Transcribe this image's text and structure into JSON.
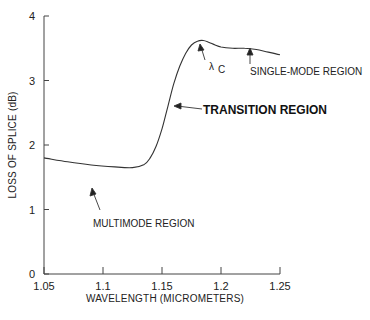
{
  "chart_data": {
    "type": "line",
    "title": "",
    "xlabel": "WAVELENGTH (MICROMETERS)",
    "ylabel": "LOSS OF SPLICE (dB)",
    "xlim": [
      1.05,
      1.25
    ],
    "ylim": [
      0,
      4
    ],
    "x_ticks": [
      "1.05",
      "1.1",
      "1.15",
      "1.2",
      "1.25"
    ],
    "y_ticks": [
      "0",
      "1",
      "2",
      "3",
      "4"
    ],
    "grid": false,
    "legend": null,
    "series": [
      {
        "name": "Splice loss",
        "x": [
          1.05,
          1.07,
          1.09,
          1.11,
          1.125,
          1.135,
          1.14,
          1.145,
          1.15,
          1.155,
          1.16,
          1.165,
          1.17,
          1.175,
          1.18,
          1.185,
          1.19,
          1.195,
          1.2,
          1.21,
          1.22,
          1.23,
          1.24,
          1.25
        ],
        "values": [
          1.8,
          1.74,
          1.69,
          1.66,
          1.65,
          1.7,
          1.8,
          1.98,
          2.25,
          2.6,
          2.95,
          3.22,
          3.42,
          3.55,
          3.61,
          3.62,
          3.59,
          3.55,
          3.52,
          3.5,
          3.5,
          3.48,
          3.44,
          3.4
        ]
      }
    ],
    "annotations": [
      {
        "text": "MULTIMODE REGION",
        "x": 1.115,
        "y": 1.65,
        "bold": false
      },
      {
        "text": "TRANSITION REGION",
        "x": 1.16,
        "y": 2.65,
        "bold": true
      },
      {
        "text": "λ",
        "subscript": "C",
        "x": 1.185,
        "y": 3.62,
        "bold": false
      },
      {
        "text": "SINGLE-MODE REGION",
        "x": 1.225,
        "y": 3.5,
        "bold": false
      }
    ]
  },
  "labels": {
    "xlabel": "WAVELENGTH (MICROMETERS)",
    "ylabel": "LOSS OF SPLICE (dB)",
    "multimode": "MULTIMODE REGION",
    "transition": "TRANSITION REGION",
    "lambda": "λ",
    "lambda_sub": "C",
    "singlemode": "SINGLE-MODE REGION"
  }
}
